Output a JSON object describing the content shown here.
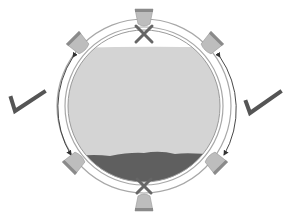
{
  "diagram": {
    "title": "Pipe cross-section mounting positions",
    "colors": {
      "background": "#ffffff",
      "ring_stroke": "#9a9a9a",
      "fluid": "#d6d6d6",
      "sediment": "#5e5e5e",
      "mount_fill": "#bdbdbd",
      "mount_cap": "#8a8a8a",
      "mark": "#555555",
      "arrow": "#333333"
    },
    "pipe": {
      "center": [
        144,
        106
      ],
      "outer_radius": 87,
      "inner_radius": 76,
      "contents": [
        {
          "name": "gas-space",
          "position": "top"
        },
        {
          "name": "liquid",
          "position": "middle"
        },
        {
          "name": "sediment",
          "position": "bottom"
        }
      ]
    },
    "mounts": [
      {
        "id": "top",
        "angle_deg": 0,
        "status": "not-recommended",
        "mark": "x"
      },
      {
        "id": "upper-right",
        "angle_deg": 45,
        "status": "recommended",
        "mark": "none"
      },
      {
        "id": "lower-right",
        "angle_deg": 135,
        "status": "recommended",
        "mark": "none"
      },
      {
        "id": "bottom",
        "angle_deg": 180,
        "status": "not-recommended",
        "mark": "x"
      },
      {
        "id": "lower-left",
        "angle_deg": 225,
        "status": "recommended",
        "mark": "none"
      },
      {
        "id": "upper-left",
        "angle_deg": 315,
        "status": "recommended",
        "mark": "none"
      }
    ],
    "ranges": [
      {
        "side": "left",
        "from": "upper-left",
        "to": "lower-left",
        "mark": "check"
      },
      {
        "side": "right",
        "from": "upper-right",
        "to": "lower-right",
        "mark": "check"
      }
    ]
  }
}
